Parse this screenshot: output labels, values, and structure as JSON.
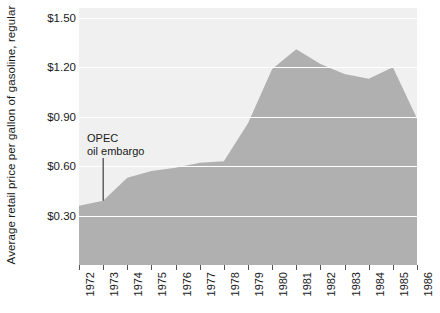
{
  "chart_data": {
    "type": "area",
    "title": "",
    "xlabel": "",
    "ylabel": "Average retail price per gallon of gasoline, regular",
    "categories": [
      1972,
      1973,
      1974,
      1975,
      1976,
      1977,
      1978,
      1979,
      1980,
      1981,
      1982,
      1983,
      1984,
      1985,
      1986
    ],
    "x_tick_labels": [
      "1972",
      "1973",
      "1974",
      "1975",
      "1976",
      "1977",
      "1978",
      "1979",
      "1980",
      "1981",
      "1982",
      "1983",
      "1984",
      "1985",
      "1986"
    ],
    "values": [
      0.36,
      0.39,
      0.53,
      0.57,
      0.59,
      0.62,
      0.63,
      0.86,
      1.19,
      1.31,
      1.22,
      1.16,
      1.13,
      1.2,
      0.89
    ],
    "y_tick_labels": [
      "$1.50",
      "$1.20",
      "$0.90",
      "$0.60",
      "$0.30"
    ],
    "y_tick_values": [
      1.5,
      1.2,
      0.9,
      0.6,
      0.3
    ],
    "ylim": [
      0.0,
      1.56
    ],
    "xlim": [
      1972,
      1986
    ],
    "grid": "horizontal",
    "legend": "none",
    "annotations": [
      {
        "name": "opec-oil-embargo",
        "line1": "OPEC",
        "line2": "oil embargo",
        "points_to_year": 1973,
        "points_to_value": 0.39
      }
    ],
    "colors": {
      "area_fill": "#b0b0b0",
      "plot_background": "#f0f0f0",
      "gridline": "#ffffff",
      "text": "#1a1a1a",
      "tick_mark": "#555555",
      "leader_line": "#1a1a1a"
    }
  }
}
